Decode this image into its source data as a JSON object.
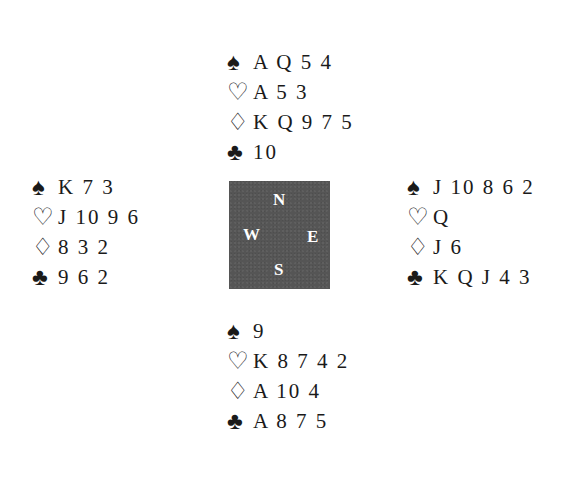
{
  "diagram": {
    "type": "bridge-deal",
    "suit_symbols": {
      "spades": "♠",
      "hearts": "♡",
      "diamonds": "♢",
      "clubs": "♣"
    },
    "compass": {
      "north": "N",
      "west": "W",
      "east": "E",
      "south": "S",
      "background_color": "#555555",
      "text_color": "#ffffff"
    },
    "hands": {
      "north": {
        "spades": "A Q 5 4",
        "hearts": "A 5 3",
        "diamonds": "K Q 9 7 5",
        "clubs": "10"
      },
      "west": {
        "spades": "K 7 3",
        "hearts": "J 10 9 6",
        "diamonds": "8 3 2",
        "clubs": "9 6 2"
      },
      "east": {
        "spades": "J 10 8 6 2",
        "hearts": "Q",
        "diamonds": "J 6",
        "clubs": "K Q J 4 3"
      },
      "south": {
        "spades": "9",
        "hearts": "K 8 7 4 2",
        "diamonds": "A 10 4",
        "clubs": "A 8 7 5"
      }
    }
  }
}
